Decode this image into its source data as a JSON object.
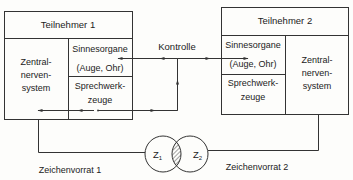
{
  "diagram": {
    "participant1": {
      "title": "Teilnehmer 1",
      "cns": [
        "Zentral-",
        "nerven-",
        "system"
      ],
      "senses": [
        "Sinnesorgane",
        "(Auge, Ohr)"
      ],
      "speech": [
        "Sprechwerk-",
        "zeuge"
      ]
    },
    "participant2": {
      "title": "Teilnehmer 2",
      "cns": [
        "Zentral-",
        "nerven-",
        "system"
      ],
      "senses": [
        "Sinnesorgane",
        "(Auge, Ohr)"
      ],
      "speech": [
        "Sprechwerk-",
        "zeuge"
      ]
    },
    "control_label": "Kontrolle",
    "sets": {
      "z1": "Z",
      "z1_sub": "1",
      "z2": "Z",
      "z2_sub": "2",
      "label1": "Zeichenvorrat 1",
      "label2": "Zeichenvorrat 2"
    },
    "colors": {
      "line": "#333333",
      "text": "#222222",
      "background": "#fdfdfb"
    }
  }
}
